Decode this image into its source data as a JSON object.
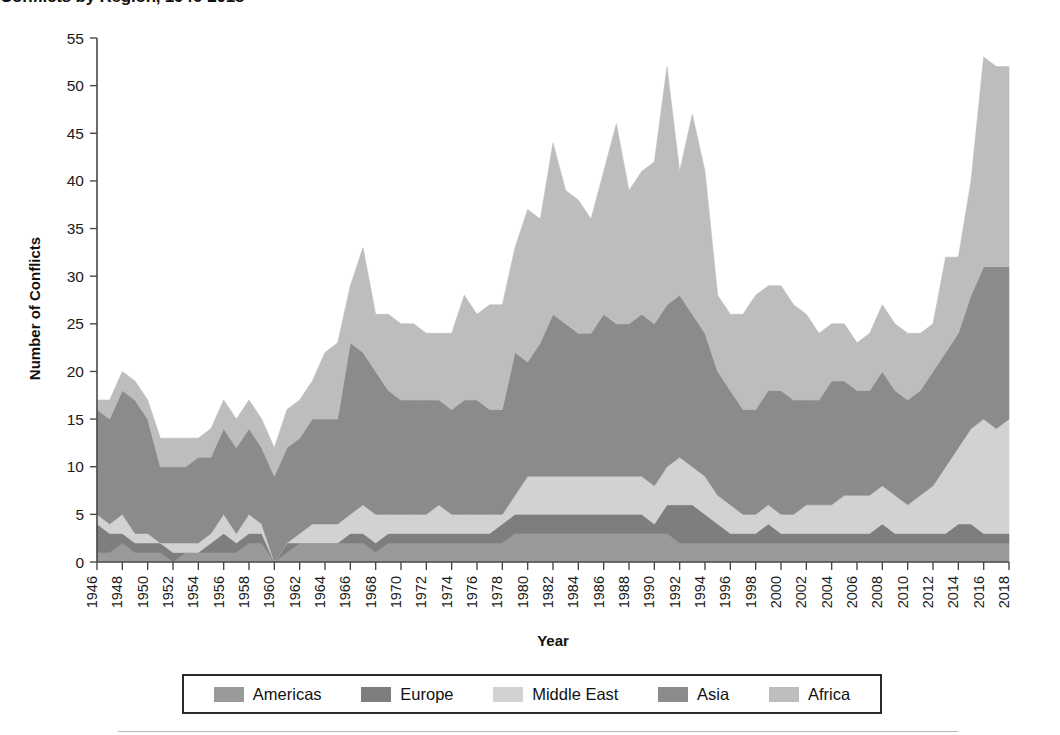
{
  "title": "Conflicts by Region, 1946-2018",
  "axes": {
    "x_title": "Year",
    "y_title": "Number of Conflicts"
  },
  "legend": {
    "entries": [
      {
        "label": "Americas",
        "color": "#9a9a9a",
        "icon": "legend-swatch-icon"
      },
      {
        "label": "Europe",
        "color": "#7e7e7e",
        "icon": "legend-swatch-icon"
      },
      {
        "label": "Middle East",
        "color": "#d2d2d2",
        "icon": "legend-swatch-icon"
      },
      {
        "label": "Asia",
        "color": "#8b8b8b",
        "icon": "legend-swatch-icon"
      },
      {
        "label": "Africa",
        "color": "#bdbdbd",
        "icon": "legend-swatch-icon"
      }
    ]
  },
  "chart_data": {
    "type": "area",
    "stacked": true,
    "title": "Conflicts by Region, 1946-2018",
    "xlabel": "Year",
    "ylabel": "Number of Conflicts",
    "xlim": [
      1946,
      2018
    ],
    "ylim": [
      0,
      55
    ],
    "ytick_step": 5,
    "xtick_step": 2,
    "grid": false,
    "legend_position": "bottom",
    "yticks": [
      0,
      5,
      10,
      15,
      20,
      25,
      30,
      35,
      40,
      45,
      50,
      55
    ],
    "x": [
      1946,
      1947,
      1948,
      1949,
      1950,
      1951,
      1952,
      1953,
      1954,
      1955,
      1956,
      1957,
      1958,
      1959,
      1960,
      1961,
      1962,
      1963,
      1964,
      1965,
      1966,
      1967,
      1968,
      1969,
      1970,
      1971,
      1972,
      1973,
      1974,
      1975,
      1976,
      1977,
      1978,
      1979,
      1980,
      1981,
      1982,
      1983,
      1984,
      1985,
      1986,
      1987,
      1988,
      1989,
      1990,
      1991,
      1992,
      1993,
      1994,
      1995,
      1996,
      1997,
      1998,
      1999,
      2000,
      2001,
      2002,
      2003,
      2004,
      2005,
      2006,
      2007,
      2008,
      2009,
      2010,
      2011,
      2012,
      2013,
      2014,
      2015,
      2016,
      2017,
      2018
    ],
    "xticks": [
      1946,
      1948,
      1950,
      1952,
      1954,
      1956,
      1958,
      1960,
      1962,
      1964,
      1966,
      1968,
      1970,
      1972,
      1974,
      1976,
      1978,
      1980,
      1982,
      1984,
      1986,
      1988,
      1990,
      1992,
      1994,
      1996,
      1998,
      2000,
      2002,
      2004,
      2006,
      2008,
      2010,
      2012,
      2014,
      2016,
      2018
    ],
    "series": [
      {
        "name": "Americas",
        "color": "#9a9a9a",
        "values": [
          1,
          1,
          2,
          1,
          1,
          1,
          0,
          1,
          1,
          1,
          1,
          1,
          2,
          2,
          0,
          1,
          2,
          2,
          2,
          2,
          2,
          2,
          1,
          2,
          2,
          2,
          2,
          2,
          2,
          2,
          2,
          2,
          2,
          3,
          3,
          3,
          3,
          3,
          3,
          3,
          3,
          3,
          3,
          3,
          3,
          3,
          2,
          2,
          2,
          2,
          2,
          2,
          2,
          2,
          2,
          2,
          2,
          2,
          2,
          2,
          2,
          2,
          2,
          2,
          2,
          2,
          2,
          2,
          2,
          2,
          2,
          2,
          2
        ]
      },
      {
        "name": "Europe",
        "color": "#7e7e7e",
        "values": [
          3,
          2,
          1,
          1,
          1,
          1,
          1,
          0,
          0,
          1,
          2,
          1,
          1,
          1,
          0,
          1,
          0,
          0,
          0,
          0,
          1,
          1,
          1,
          1,
          1,
          1,
          1,
          1,
          1,
          1,
          1,
          1,
          2,
          2,
          2,
          2,
          2,
          2,
          2,
          2,
          2,
          2,
          2,
          2,
          1,
          3,
          4,
          4,
          3,
          2,
          1,
          1,
          1,
          2,
          1,
          1,
          1,
          1,
          1,
          1,
          1,
          1,
          2,
          1,
          1,
          1,
          1,
          1,
          2,
          2,
          1,
          1,
          1
        ]
      },
      {
        "name": "Middle East",
        "color": "#d2d2d2",
        "values": [
          1,
          1,
          2,
          1,
          1,
          0,
          1,
          1,
          1,
          1,
          2,
          1,
          2,
          1,
          0,
          0,
          1,
          2,
          2,
          2,
          2,
          3,
          3,
          2,
          2,
          2,
          2,
          3,
          2,
          2,
          2,
          2,
          1,
          2,
          4,
          4,
          4,
          4,
          4,
          4,
          4,
          4,
          4,
          4,
          4,
          4,
          5,
          4,
          4,
          3,
          3,
          2,
          2,
          2,
          2,
          2,
          3,
          3,
          3,
          4,
          4,
          4,
          4,
          4,
          3,
          4,
          5,
          7,
          8,
          10,
          12,
          11,
          12
        ]
      },
      {
        "name": "Asia",
        "color": "#8b8b8b",
        "values": [
          11,
          11,
          13,
          14,
          12,
          8,
          8,
          8,
          9,
          8,
          9,
          9,
          9,
          8,
          9,
          10,
          10,
          11,
          11,
          11,
          18,
          16,
          15,
          13,
          12,
          12,
          12,
          11,
          11,
          12,
          12,
          11,
          11,
          15,
          12,
          14,
          17,
          16,
          15,
          15,
          17,
          16,
          16,
          17,
          17,
          17,
          17,
          16,
          15,
          13,
          12,
          11,
          11,
          12,
          13,
          12,
          11,
          11,
          13,
          12,
          11,
          11,
          12,
          11,
          11,
          11,
          12,
          12,
          12,
          14,
          16,
          17,
          16
        ]
      },
      {
        "name": "Africa",
        "color": "#bdbdbd",
        "values": [
          1,
          2,
          2,
          2,
          2,
          3,
          3,
          3,
          2,
          3,
          3,
          3,
          3,
          3,
          3,
          4,
          4,
          4,
          7,
          8,
          6,
          11,
          6,
          8,
          8,
          8,
          7,
          7,
          8,
          11,
          9,
          11,
          11,
          11,
          16,
          13,
          18,
          14,
          14,
          12,
          15,
          21,
          14,
          15,
          17,
          25,
          13,
          21,
          17,
          8,
          8,
          10,
          12,
          11,
          11,
          10,
          9,
          7,
          6,
          6,
          5,
          6,
          7,
          7,
          7,
          6,
          5,
          10,
          8,
          12,
          22,
          21,
          21
        ]
      }
    ]
  }
}
